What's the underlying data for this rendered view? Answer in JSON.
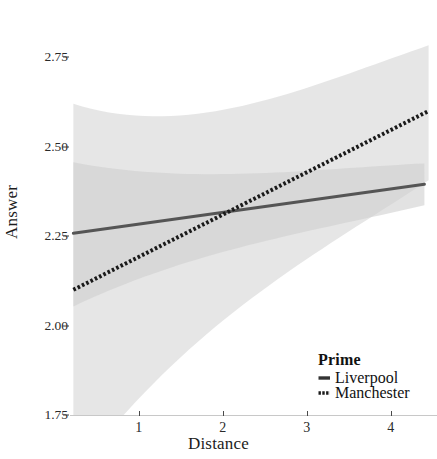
{
  "chart_data": {
    "type": "line",
    "title": "",
    "xlabel": "Distance",
    "ylabel": "Answer",
    "xlim": [
      0.18,
      4.55
    ],
    "ylim": [
      1.75,
      2.86
    ],
    "xticks": [
      "1",
      "2",
      "3",
      "4"
    ],
    "xtick_values": [
      1,
      2,
      3,
      4
    ],
    "yticks": [
      "2.75",
      "2.50",
      "2.25",
      "2.00",
      "1.75"
    ],
    "ytick_values": [
      2.75,
      2.5,
      2.25,
      2.0,
      1.75
    ],
    "grid": false,
    "legend_position": "bottom-right",
    "legend_title": "Prime",
    "series": [
      {
        "name": "Liverpool",
        "linestyle": "solid",
        "color": "#555555",
        "x": [
          0.22,
          4.4
        ],
        "y": [
          2.258,
          2.395
        ],
        "ci_upper": [
          2.41,
          2.44
        ],
        "ci_lower": [
          2.1,
          2.35
        ]
      },
      {
        "name": "Manchester",
        "linestyle": "dotted",
        "color": "#1a1a1a",
        "x": [
          0.22,
          4.45
        ],
        "y": [
          2.1,
          2.6
        ],
        "ci_upper": [
          2.5,
          2.74
        ],
        "ci_lower": [
          1.7,
          2.45
        ]
      }
    ],
    "band_color": "#d9d9d9",
    "band_opacity": 0.55
  },
  "axes": {
    "y_title": "Answer",
    "x_title": "Distance"
  },
  "legend": {
    "title": "Prime",
    "entries": [
      {
        "label": "Liverpool",
        "key": "solid-line-key"
      },
      {
        "label": "Manchester",
        "key": "dotted-line-key"
      }
    ]
  }
}
